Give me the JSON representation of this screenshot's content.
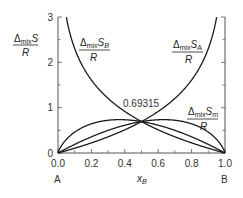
{
  "chart_data": {
    "type": "line",
    "title": "",
    "xlabel": "x_B",
    "ylabel": "",
    "xlim": [
      0.0,
      1.0
    ],
    "ylim": [
      0,
      3
    ],
    "grid": false,
    "x_ticks": [
      "0.0",
      "0.2",
      "0.4",
      "0.6",
      "0.8",
      "1.0"
    ],
    "y_ticks": [
      "0",
      "1",
      "2",
      "3"
    ],
    "x_end_labels": {
      "left": "A",
      "right": "B"
    },
    "annotation": {
      "text": "0.69315",
      "x": 0.5,
      "y": 0.69315
    },
    "series": [
      {
        "name": "ΔmixS_B / R",
        "function": "-ln(x_B)",
        "label_main": "Δ",
        "label_sub": "mix",
        "label_var": "S",
        "label_varsub": "B",
        "label_den": "R"
      },
      {
        "name": "ΔmixS_A / R",
        "function": "-ln(1 - x_B)",
        "label_main": "Δ",
        "label_sub": "mix",
        "label_var": "S",
        "label_varsub": "A",
        "label_den": "R"
      },
      {
        "name": "Curve 3",
        "function": "-2 x_B ln(x_B)"
      },
      {
        "name": "ΔmixS_m / R",
        "function": "-2 (1 - x_B) ln(1 - x_B)",
        "label_main": "Δ",
        "label_sub": "mix",
        "label_var": "S",
        "label_varsub": "m",
        "label_den": "R"
      }
    ],
    "ylabel_fraction": {
      "main": "Δ",
      "sub": "mix",
      "var": "S",
      "den": "R"
    }
  }
}
